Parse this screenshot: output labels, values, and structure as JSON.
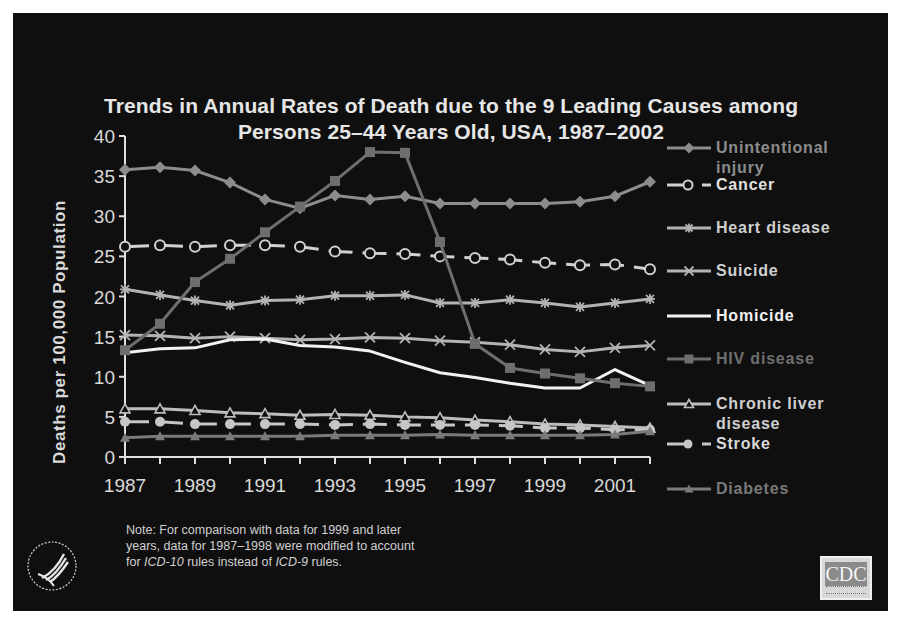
{
  "slide": {
    "title_line1": "Trends in Annual Rates of Death due to the 9 Leading Causes among",
    "title_line2": "Persons 25–44 Years Old, USA, 1987–2002",
    "note": "Note: For comparison with data for 1999 and later years, data for 1987–1998 were modified to account for ICD-10 rules instead of ICD-9 rules.",
    "note_parts": {
      "pre": "Note: For comparison with data for 1999 and later",
      "line2": "years, data for 1987–1998 were modified to account",
      "line3_a": "for ",
      "line3_icd10": "ICD-10",
      "line3_b": " rules instead of ",
      "line3_icd9": "ICD-9",
      "line3_c": " rules."
    },
    "logo_left": "hhs-eagle-logo",
    "logo_right": "CDC",
    "colors": {
      "background": "#0f0f0f",
      "text": "#e6e6e6",
      "series_light": "#d9d9d9",
      "series_mid": "#a6a6a6",
      "series_dark": "#7f7f7f"
    }
  },
  "chart_data": {
    "type": "line",
    "xlabel": "",
    "ylabel": "Deaths per 100,000 Population",
    "ylim": [
      0,
      40
    ],
    "yticks": [
      0,
      5,
      10,
      15,
      20,
      25,
      30,
      35,
      40
    ],
    "xticks_labeled": [
      "1987",
      "1989",
      "1991",
      "1993",
      "1995",
      "1997",
      "1999",
      "2001"
    ],
    "grid": false,
    "legend_position": "right",
    "x": [
      1987,
      1988,
      1989,
      1990,
      1991,
      1992,
      1993,
      1994,
      1995,
      1996,
      1997,
      1998,
      1999,
      2000,
      2001,
      2002
    ],
    "series": [
      {
        "name": "Unintentional injury",
        "marker": "diamond",
        "dash": false,
        "color": "#8c8c8c",
        "label_color": "#8c8c8c",
        "values": [
          35.8,
          36.1,
          35.7,
          34.2,
          32.1,
          31.0,
          32.6,
          32.1,
          32.5,
          31.6,
          31.6,
          31.6,
          31.6,
          31.8,
          32.5,
          34.3
        ]
      },
      {
        "name": "Cancer",
        "marker": "open-circle",
        "dash": true,
        "color": "#d0d0d0",
        "label_color": "#e0e0e0",
        "values": [
          26.2,
          26.4,
          26.2,
          26.4,
          26.4,
          26.2,
          25.6,
          25.4,
          25.3,
          25.0,
          24.8,
          24.6,
          24.2,
          23.9,
          24.0,
          23.4
        ]
      },
      {
        "name": "Heart disease",
        "marker": "asterisk",
        "dash": false,
        "color": "#b3b3b3",
        "label_color": "#cfcfcf",
        "values": [
          20.9,
          20.2,
          19.5,
          18.9,
          19.5,
          19.6,
          20.1,
          20.1,
          20.2,
          19.2,
          19.2,
          19.6,
          19.2,
          18.7,
          19.2,
          19.7
        ]
      },
      {
        "name": "Suicide",
        "marker": "x",
        "dash": false,
        "color": "#b3b3b3",
        "label_color": "#cfcfcf",
        "values": [
          15.2,
          15.1,
          14.8,
          15.0,
          14.8,
          14.6,
          14.7,
          14.9,
          14.8,
          14.5,
          14.3,
          14.0,
          13.4,
          13.1,
          13.6,
          13.9
        ]
      },
      {
        "name": "Homicide",
        "marker": "none",
        "dash": false,
        "color": "#f2f2f2",
        "label_color": "#f2f2f2",
        "values": [
          13.0,
          13.5,
          13.6,
          14.6,
          14.7,
          13.9,
          13.7,
          13.2,
          11.8,
          10.5,
          9.9,
          9.2,
          8.6,
          8.6,
          10.9,
          8.9
        ]
      },
      {
        "name": "HIV disease",
        "marker": "square",
        "dash": false,
        "color": "#6e6e6e",
        "label_color": "#6e6e6e",
        "values": [
          13.3,
          16.6,
          21.8,
          24.7,
          28.0,
          31.2,
          34.4,
          38.0,
          37.9,
          26.8,
          14.1,
          11.1,
          10.4,
          9.8,
          9.2,
          8.8
        ]
      },
      {
        "name": "Chronic liver disease",
        "marker": "open-triangle",
        "dash": false,
        "color": "#bdbdbd",
        "label_color": "#cfcfcf",
        "values": [
          6.0,
          6.0,
          5.8,
          5.5,
          5.4,
          5.2,
          5.3,
          5.2,
          5.0,
          4.9,
          4.6,
          4.4,
          4.1,
          4.0,
          3.8,
          3.6
        ]
      },
      {
        "name": "Stroke",
        "marker": "filled-circle",
        "dash": true,
        "color": "#c6c6c6",
        "label_color": "#d9d9d9",
        "values": [
          4.4,
          4.4,
          4.1,
          4.1,
          4.1,
          4.1,
          4.0,
          4.1,
          4.0,
          4.0,
          4.0,
          3.9,
          3.6,
          3.6,
          3.4,
          3.4
        ]
      },
      {
        "name": "Diabetes",
        "marker": "filled-triangle",
        "dash": false,
        "color": "#7a7a7a",
        "label_color": "#7a7a7a",
        "values": [
          2.4,
          2.6,
          2.6,
          2.6,
          2.6,
          2.6,
          2.7,
          2.7,
          2.7,
          2.8,
          2.7,
          2.7,
          2.7,
          2.7,
          2.8,
          3.2
        ]
      }
    ]
  },
  "legend": {
    "items": [
      {
        "line1": "Unintentional",
        "line2": "injury",
        "y": 138
      },
      {
        "line1": "Cancer",
        "line2": "",
        "y": 175
      },
      {
        "line1": "Heart disease",
        "line2": "",
        "y": 218
      },
      {
        "line1": "Suicide",
        "line2": "",
        "y": 261
      },
      {
        "line1": "Homicide",
        "line2": "",
        "y": 306
      },
      {
        "line1": "HIV disease",
        "line2": "",
        "y": 349
      },
      {
        "line1": "Chronic liver",
        "line2": "disease",
        "y": 394
      },
      {
        "line1": "Stroke",
        "line2": "",
        "y": 434
      },
      {
        "line1": "Diabetes",
        "line2": "",
        "y": 479
      }
    ]
  }
}
